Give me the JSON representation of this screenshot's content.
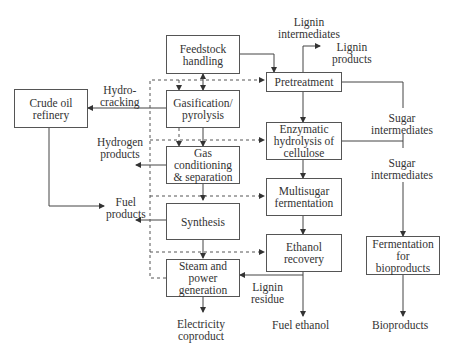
{
  "boxes": {
    "feedstock": "Feedstock\nhandling",
    "gasification": "Gasification/\npyrolysis",
    "gas_conditioning": "Gas\nconditioning\n& separation",
    "synthesis": "Synthesis",
    "steam_power": "Steam and\npower\ngeneration",
    "crude_oil": "Crude oil\nrefinery",
    "pretreatment": "Pretreatment",
    "enzymatic": "Enzymatic\nhydrolysis of\ncellulose",
    "multisugar": "Multisugar\nfermentation",
    "ethanol_recovery": "Ethanol\nrecovery",
    "fermentation_bio": "Fermentation\nfor\nbioproducts"
  },
  "labels": {
    "lignin_intermediates": "Lignin\nintermediates",
    "lignin_products": "Lignin\nproducts",
    "hydrocracking": "Hydro-\ncracking",
    "hydrogen_products": "Hydrogen\nproducts",
    "fuel_products": "Fuel\nproducts",
    "sugar_intermediates_1": "Sugar\nintermediates",
    "sugar_intermediates_2": "Sugar\nintermediates",
    "lignin_residue": "Lignin\nresidue",
    "electricity": "Electricity\ncoproduct",
    "fuel_ethanol": "Fuel ethanol",
    "bioproducts": "Bioproducts"
  }
}
